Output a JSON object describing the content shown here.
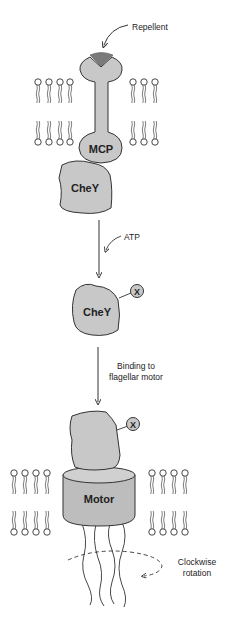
{
  "diagram": {
    "labels": {
      "repellent": "Repellent",
      "mcp": "MCP",
      "chey_1": "CheY",
      "atp": "ATP",
      "chey_2": "CheY",
      "phospho_2": "X",
      "binding_line1": "Binding to",
      "binding_line2": "flagellar motor",
      "phospho_3": "X",
      "motor": "Motor",
      "rotation_line1": "Clockwise",
      "rotation_line2": "rotation"
    },
    "colors": {
      "protein_fill": "#c8c8c8",
      "motor_fill": "#bdbdbd",
      "motor_top": "#d0d0d0",
      "repellent_fill": "#7a7a7a",
      "stroke": "#333333",
      "background": "#ffffff"
    },
    "steps": [
      "Repellent binds MCP receptor",
      "CheY associates with MCP",
      "ATP-dependent phosphorylation of CheY",
      "Phosphorylated CheY binds flagellar motor",
      "Clockwise rotation"
    ]
  }
}
